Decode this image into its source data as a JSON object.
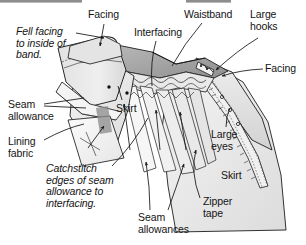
{
  "figure": {
    "title_alt": "Waistband construction with facing, interfacing and zipper tape",
    "top_rule_color": "#8d8d8d",
    "fabric_fill": "#e8e8e8",
    "fabric_fill_light": "#f2f2f2",
    "fabric_fill_dark": "#cfcfcf",
    "ink_color": "#141414"
  },
  "labels": [
    {
      "id": "facing-top",
      "text": "Facing",
      "style": "plain",
      "x": 88,
      "y": 9,
      "align": "left"
    },
    {
      "id": "interfacing",
      "text": "Interfacing",
      "style": "plain",
      "x": 134,
      "y": 27,
      "align": "left"
    },
    {
      "id": "waistband",
      "text": "Waistband",
      "style": "plain",
      "x": 184,
      "y": 9,
      "align": "left"
    },
    {
      "id": "large-hooks",
      "text": "Large\nhooks",
      "style": "plain",
      "x": 250,
      "y": 9,
      "align": "left"
    },
    {
      "id": "facing-right",
      "text": "Facing",
      "style": "plain",
      "x": 265,
      "y": 63,
      "align": "left"
    },
    {
      "id": "fell-facing-note",
      "text": "Fell facing\nto inside of\nband.",
      "style": "italic",
      "x": 16,
      "y": 26,
      "align": "left"
    },
    {
      "id": "seam-allowance",
      "text": "Seam\nallowance",
      "style": "plain",
      "x": 8,
      "y": 99,
      "align": "left"
    },
    {
      "id": "lining-fabric",
      "text": "Lining\nfabric",
      "style": "plain",
      "x": 8,
      "y": 136,
      "align": "left"
    },
    {
      "id": "skirt-left",
      "text": "Skirt",
      "style": "plain",
      "x": 116,
      "y": 103,
      "align": "left"
    },
    {
      "id": "catchstitch-note",
      "text": "Catchstitch\nedges of seam\nallowance to\ninterfacing.",
      "style": "italic",
      "x": 46,
      "y": 163,
      "align": "left"
    },
    {
      "id": "large-eyes",
      "text": "Large\neyes",
      "style": "plain",
      "x": 211,
      "y": 129,
      "align": "left"
    },
    {
      "id": "skirt-right",
      "text": "Skirt",
      "style": "plain",
      "x": 221,
      "y": 170,
      "align": "left"
    },
    {
      "id": "zipper-tape",
      "text": "Zipper\ntape",
      "style": "plain",
      "x": 203,
      "y": 196,
      "align": "left"
    },
    {
      "id": "seam-allowances",
      "text": "Seam\nallowances",
      "style": "plain",
      "x": 138,
      "y": 212,
      "align": "left"
    }
  ],
  "leader_lines": [
    {
      "id": "leader-fell-facing",
      "from": "fell-facing-note",
      "to": "waistband-left-end",
      "arrow": true
    },
    {
      "id": "leader-facing-top",
      "from": "facing-top",
      "to": "band-facing-top",
      "arrow": true
    },
    {
      "id": "leader-interfacing",
      "from": "interfacing",
      "to": "band-interfacing",
      "arrow": false
    },
    {
      "id": "leader-waistband",
      "from": "waistband",
      "to": "band-body",
      "arrow": false
    },
    {
      "id": "leader-large-hooks",
      "from": "large-hooks",
      "to": "hooks",
      "arrow": true
    },
    {
      "id": "leader-facing-right",
      "from": "facing-right",
      "to": "right-facing",
      "arrow": true
    },
    {
      "id": "leader-seam-allowance",
      "from": "seam-allowance",
      "to": "seam-allowance-edge",
      "arrow": false
    },
    {
      "id": "leader-lining-fabric",
      "from": "lining-fabric",
      "to": "lining-panel",
      "arrow": false
    },
    {
      "id": "leader-skirt-left",
      "from": "skirt-left",
      "to": "skirt-panel-left",
      "arrow": false
    },
    {
      "id": "leader-catchstitch",
      "from": "catchstitch-note",
      "to": "catchstitch-area",
      "arrow": false
    },
    {
      "id": "leader-large-eyes",
      "from": "large-eyes",
      "to": "eyes",
      "arrow": false
    },
    {
      "id": "leader-zipper-tape",
      "from": "zipper-tape",
      "to": "zipper-tape-strip",
      "arrow": true
    },
    {
      "id": "leader-seam-allowances",
      "from": "seam-allowances",
      "to": "seam-allowance-strips",
      "arrow": true
    }
  ]
}
